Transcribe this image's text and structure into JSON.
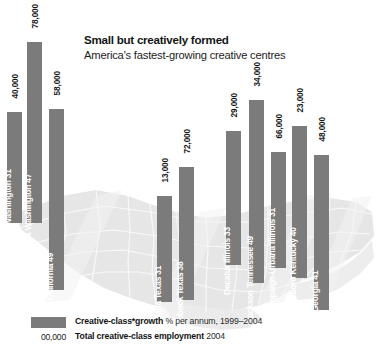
{
  "header": {
    "title": "Small but creatively formed",
    "subtitle": "America's fastest-growing creative centres"
  },
  "legend": {
    "growth_label": "Creative-class*growth",
    "growth_note": "% per annum, 1999–2004",
    "employment_key": "00,000",
    "employment_label": "Total creative-class employment",
    "employment_note": "2004"
  },
  "colors": {
    "bar": "#7b7b7b",
    "map_land": "#e4e4e4",
    "map_border": "#f7f7f7",
    "text": "#141414",
    "bar_label": "#ffffff"
  },
  "chart_data": {
    "type": "bar",
    "title": "Small but creatively formed",
    "subtitle": "America's fastest-growing creative centres",
    "xlabel": "",
    "ylabel": "Creative-class growth, % per annum, 1999–2004",
    "value_label_meaning": "Total creative-class employment, 2004",
    "grid": false,
    "legend_position": "bottom-left",
    "note": "Bar baselines are offset to match each city's geographic position on the US map backdrop; bar length encodes growth rate, the number above each bar is total creative-class employment.",
    "categories": [
      "Bremerton Washington 31",
      "Olympia Washington 47",
      "Yolo California 49",
      "Victoria Texas 31",
      "Lubbock Texas 38",
      "Decatur Illinois 33",
      "Jackson Tennessee 49",
      "Champaign-Urbana Illinois 31",
      "Owensboro Kentucky 40",
      "Athens Georgia 41"
    ],
    "series": [
      {
        "name": "Creative-class growth (% per annum, 1999-2004)",
        "values": [
          31,
          47,
          49,
          31,
          38,
          33,
          49,
          31,
          40,
          41
        ]
      },
      {
        "name": "Total creative-class employment (2004)",
        "values": [
          40000,
          78000,
          58000,
          13000,
          72000,
          29000,
          34000,
          66000,
          23000,
          48000
        ]
      }
    ],
    "points": [
      {
        "city": "Bremerton",
        "state": "Washington",
        "growth": 31,
        "employment": 40000,
        "employment_label": "40,000",
        "category_label": "Bremerton Washington 31"
      },
      {
        "city": "Olympia",
        "state": "Washington",
        "growth": 47,
        "employment": 78000,
        "employment_label": "78,000",
        "category_label": "Olympia Washington 47"
      },
      {
        "city": "Yolo",
        "state": "California",
        "growth": 49,
        "employment": 58000,
        "employment_label": "58,000",
        "category_label": "Yolo California 49"
      },
      {
        "city": "Victoria",
        "state": "Texas",
        "growth": 31,
        "employment": 13000,
        "employment_label": "13,000",
        "category_label": "Victoria Texas 31"
      },
      {
        "city": "Lubbock",
        "state": "Texas",
        "growth": 38,
        "employment": 72000,
        "employment_label": "72,000",
        "category_label": "Lubbock Texas 38"
      },
      {
        "city": "Decatur",
        "state": "Illinois",
        "growth": 33,
        "employment": 29000,
        "employment_label": "29,000",
        "category_label": "Decatur Illinois 33"
      },
      {
        "city": "Jackson",
        "state": "Tennessee",
        "growth": 49,
        "employment": 34000,
        "employment_label": "34,000",
        "category_label": "Jackson Tennessee 49"
      },
      {
        "city": "Champaign-Urbana",
        "state": "Illinois",
        "growth": 31,
        "employment": 66000,
        "employment_label": "66,000",
        "category_label": "Champaign-Urbana Illinois 31"
      },
      {
        "city": "Owensboro",
        "state": "Kentucky",
        "growth": 40,
        "employment": 23000,
        "employment_label": "23,000",
        "category_label": "Owensboro Kentucky 40"
      },
      {
        "city": "Athens",
        "state": "Georgia",
        "growth": 41,
        "employment": 48000,
        "employment_label": "48,000",
        "category_label": "Athens Georgia 41"
      }
    ],
    "geometry": [
      {
        "x": 7,
        "top": 112,
        "bottom": 223,
        "width": 15
      },
      {
        "x": 27,
        "top": 42,
        "bottom": 223,
        "width": 15
      },
      {
        "x": 49,
        "top": 109,
        "bottom": 290,
        "width": 15
      },
      {
        "x": 157,
        "top": 196,
        "bottom": 302,
        "width": 15
      },
      {
        "x": 179,
        "top": 167,
        "bottom": 300,
        "width": 15
      },
      {
        "x": 226,
        "top": 131,
        "bottom": 265,
        "width": 15
      },
      {
        "x": 249,
        "top": 100,
        "bottom": 283,
        "width": 15
      },
      {
        "x": 271,
        "top": 152,
        "bottom": 268,
        "width": 15
      },
      {
        "x": 292,
        "top": 126,
        "bottom": 278,
        "width": 15
      },
      {
        "x": 314,
        "top": 155,
        "bottom": 310,
        "width": 15
      }
    ]
  }
}
